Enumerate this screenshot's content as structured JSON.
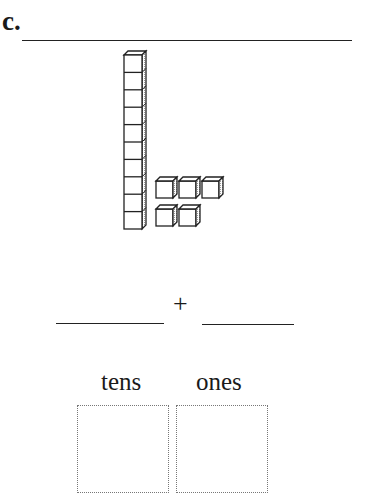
{
  "problem": {
    "label": "c.",
    "answer_line": ""
  },
  "model": {
    "tens_rods": 1,
    "cubes_per_rod": 10,
    "ones_cubes": 5,
    "ones_rows": [
      3,
      2
    ]
  },
  "equation": {
    "blank_left": "",
    "operator": "+",
    "blank_right": ""
  },
  "place_value": {
    "tens_label": "tens",
    "ones_label": "ones",
    "tens_value": "",
    "ones_value": ""
  }
}
